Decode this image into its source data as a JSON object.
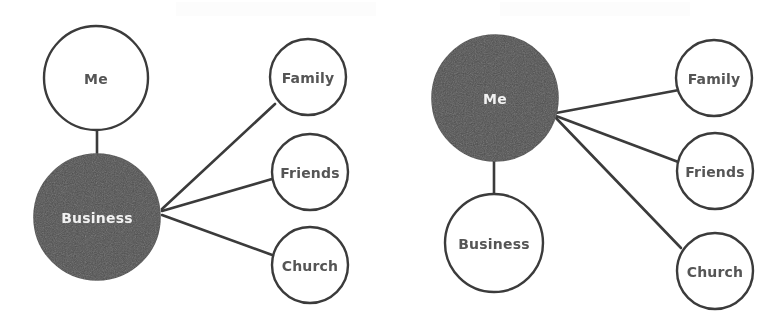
{
  "image": {
    "width": 782,
    "height": 331,
    "background_color": "#ffffff",
    "kind": "scanned-figure"
  },
  "palette": {
    "node_fill_light": "#ffffff",
    "node_fill_dark": "#4e4e4e",
    "node_stroke": "#3a3a3a",
    "edge_stroke": "#3a3a3a",
    "label_on_light": "#555555",
    "label_on_dark": "#f2f2f2"
  },
  "diagrams": [
    {
      "id": "left-diagram",
      "name": "business-centered-network",
      "hub": {
        "id": "left-business",
        "label": "Business",
        "style": "dark",
        "cx": 97,
        "cy": 217,
        "r": 63
      },
      "nodes": [
        {
          "id": "left-me",
          "label": "Me",
          "style": "light",
          "cx": 96,
          "cy": 78,
          "r": 52
        },
        {
          "id": "left-family",
          "label": "Family",
          "style": "light",
          "cx": 308,
          "cy": 77,
          "r": 38
        },
        {
          "id": "left-friends",
          "label": "Friends",
          "style": "light",
          "cx": 310,
          "cy": 172,
          "r": 38
        },
        {
          "id": "left-church",
          "label": "Church",
          "style": "light",
          "cx": 310,
          "cy": 265,
          "r": 38
        }
      ],
      "edges": [
        {
          "from": "left-business",
          "to": "left-me",
          "x1": 97,
          "y1": 130,
          "x2": 97,
          "y2": 154
        },
        {
          "from": "left-business",
          "to": "left-family",
          "x1": 162,
          "y1": 209,
          "x2": 275,
          "y2": 104
        },
        {
          "from": "left-business",
          "to": "left-friends",
          "x1": 162,
          "y1": 211,
          "x2": 272,
          "y2": 179
        },
        {
          "from": "left-business",
          "to": "left-church",
          "x1": 162,
          "y1": 215,
          "x2": 275,
          "y2": 256
        }
      ]
    },
    {
      "id": "right-diagram",
      "name": "me-centered-network",
      "hub": {
        "id": "right-me",
        "label": "Me",
        "style": "dark",
        "cx": 495,
        "cy": 98,
        "r": 63
      },
      "nodes": [
        {
          "id": "right-business",
          "label": "Business",
          "style": "light",
          "cx": 494,
          "cy": 243,
          "r": 49
        },
        {
          "id": "right-family",
          "label": "Family",
          "style": "light",
          "cx": 714,
          "cy": 78,
          "r": 38
        },
        {
          "id": "right-friends",
          "label": "Friends",
          "style": "light",
          "cx": 715,
          "cy": 171,
          "r": 38
        },
        {
          "id": "right-church",
          "label": "Church",
          "style": "light",
          "cx": 715,
          "cy": 271,
          "r": 38
        }
      ],
      "edges": [
        {
          "from": "right-me",
          "to": "right-business",
          "x1": 494,
          "y1": 161,
          "x2": 494,
          "y2": 196
        },
        {
          "from": "right-me",
          "to": "right-family",
          "x1": 556,
          "y1": 113,
          "x2": 679,
          "y2": 90
        },
        {
          "from": "right-me",
          "to": "right-friends",
          "x1": 556,
          "y1": 116,
          "x2": 681,
          "y2": 163
        },
        {
          "from": "right-me",
          "to": "right-church",
          "x1": 556,
          "y1": 118,
          "x2": 681,
          "y2": 248
        }
      ]
    }
  ]
}
